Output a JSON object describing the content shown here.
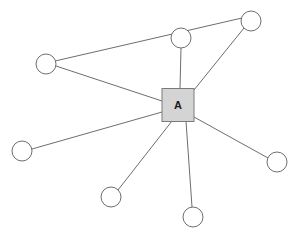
{
  "diagram": {
    "hub": {
      "label": "A",
      "shape": "square",
      "x": 178,
      "y": 105,
      "width": 32,
      "height": 33,
      "fill": "#d4d4d4",
      "stroke": "#7a7a7a"
    },
    "node_style": {
      "radius": 10,
      "fill": "#ffffff",
      "stroke": "#6e6e6e"
    },
    "edge_style": {
      "stroke": "#6e6e6e",
      "width": 1
    },
    "background": "#ffffff",
    "nodes": [
      {
        "id": "n1",
        "label": "",
        "x": 181,
        "y": 38
      },
      {
        "id": "n2",
        "label": "",
        "x": 251,
        "y": 21
      },
      {
        "id": "n3",
        "label": "",
        "x": 46,
        "y": 64
      },
      {
        "id": "n4",
        "label": "",
        "x": 22,
        "y": 151
      },
      {
        "id": "n5",
        "label": "",
        "x": 111,
        "y": 197
      },
      {
        "id": "n6",
        "label": "",
        "x": 193,
        "y": 217
      },
      {
        "id": "n7",
        "label": "",
        "x": 277,
        "y": 162
      }
    ],
    "edges": [
      {
        "from": "hub",
        "to": "n1",
        "x1": 180,
        "y1": 88,
        "x2": 181,
        "y2": 48
      },
      {
        "from": "hub",
        "to": "n2",
        "x1": 194,
        "y1": 90,
        "x2": 244,
        "y2": 28
      },
      {
        "from": "hub",
        "to": "n3",
        "x1": 162,
        "y1": 101,
        "x2": 56,
        "y2": 66
      },
      {
        "from": "hub",
        "to": "n4",
        "x1": 162,
        "y1": 112,
        "x2": 32,
        "y2": 149
      },
      {
        "from": "hub",
        "to": "n5",
        "x1": 172,
        "y1": 121,
        "x2": 118,
        "y2": 190
      },
      {
        "from": "hub",
        "to": "n6",
        "x1": 186,
        "y1": 121,
        "x2": 192,
        "y2": 207
      },
      {
        "from": "hub",
        "to": "n7",
        "x1": 194,
        "y1": 117,
        "x2": 268,
        "y2": 158
      },
      {
        "from": "n3",
        "to": "n2",
        "x1": 55,
        "y1": 61,
        "x2": 242,
        "y2": 18
      }
    ]
  }
}
